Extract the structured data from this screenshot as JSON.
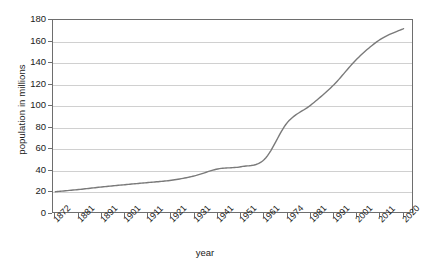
{
  "chart_data": {
    "type": "line",
    "title": "",
    "xlabel": "year",
    "ylabel": "population in millions",
    "grid": true,
    "legend": false,
    "xlim": [
      0,
      15
    ],
    "ylim": [
      0,
      180
    ],
    "ytick_step": 20,
    "categories": [
      "1872",
      "1881",
      "1891",
      "1901",
      "1911",
      "1921",
      "1931",
      "1941",
      "1951",
      "1961",
      "1974",
      "1981",
      "1991",
      "2001",
      "2011",
      "2020"
    ],
    "yticks": [
      "0",
      "20",
      "40",
      "60",
      "80",
      "100",
      "120",
      "140",
      "160",
      "180"
    ],
    "series": [
      {
        "name": "population",
        "color": "#7a7a7a",
        "values": [
          20.7,
          22.7,
          25.1,
          27.2,
          29.2,
          31.3,
          35.4,
          41.8,
          43.9,
          50.5,
          85.0,
          101.0,
          120.0,
          144.0,
          162.0,
          172.0
        ]
      }
    ]
  },
  "axes": {
    "y_axis_title": "population in millions",
    "x_axis_title": "year"
  }
}
